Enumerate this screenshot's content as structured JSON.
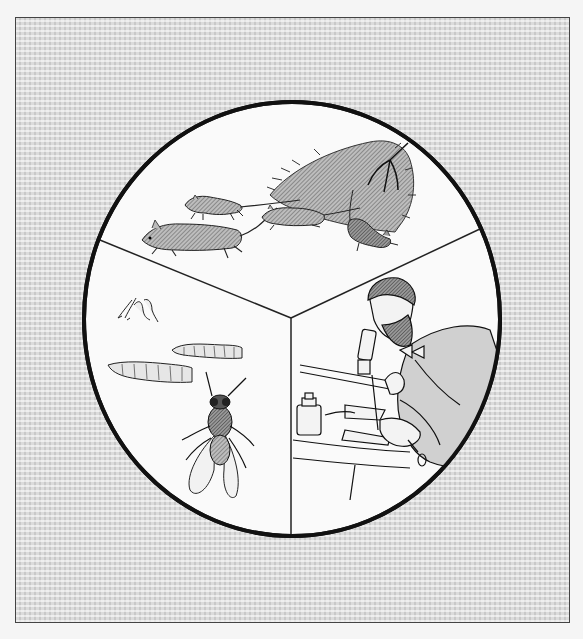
{
  "illustration": {
    "description": "Three-panel circular illustration on a gray textured background",
    "panels": [
      {
        "id": "rats",
        "subject": "Rats running away from a haystack with a pitchfork"
      },
      {
        "id": "flies",
        "subject": "Fly eggs, two maggots/larvae and an adult housefly"
      },
      {
        "id": "scientist",
        "subject": "Bearded scientist looking through a microscope at a lab bench with a jar"
      }
    ],
    "colors": {
      "background": "#c8c8c8",
      "panel_fill": "#fafafa",
      "outline": "#111111",
      "shading": "#8a8a8a"
    }
  }
}
